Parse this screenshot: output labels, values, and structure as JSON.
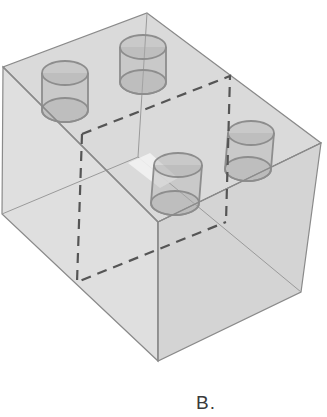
{
  "figure": {
    "type": "isometric-transparent-box",
    "option_label": "B.",
    "colors": {
      "face_fill": "#c8c8c8",
      "edge": "#8a8a8a",
      "dashed_edge": "#555555",
      "cylinder_fill": "#a8a8a8",
      "background": "#ffffff"
    },
    "cylinder_count": 4
  }
}
